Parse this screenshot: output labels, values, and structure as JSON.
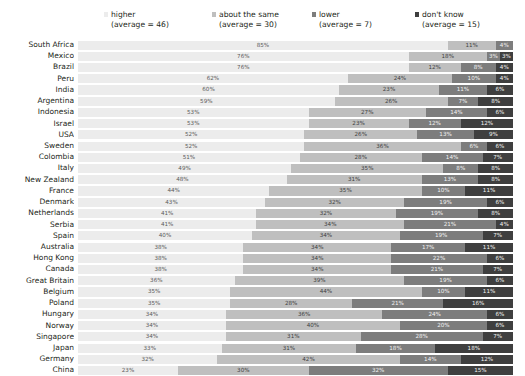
{
  "legend": {
    "items": [
      {
        "label": "higher",
        "sub": "(average = 46)",
        "color": "#ececec"
      },
      {
        "label": "about the same",
        "sub": "(average = 30)",
        "color": "#bfbfbf"
      },
      {
        "label": "lower",
        "sub": "(average = 7)",
        "color": "#7d7d7d"
      },
      {
        "label": "don't know",
        "sub": "(average = 15)",
        "color": "#3f3f3f"
      }
    ]
  },
  "chart_data": {
    "type": "bar",
    "orientation": "horizontal",
    "stacked": true,
    "stack_total": 100,
    "unit": "%",
    "title": "",
    "xlabel": "",
    "ylabel": "",
    "xlim": [
      0,
      100
    ],
    "grid": false,
    "legend_position": "top",
    "series": [
      {
        "name": "higher",
        "average": 46,
        "color": "#ececec"
      },
      {
        "name": "about the same",
        "average": 30,
        "color": "#bfbfbf"
      },
      {
        "name": "lower",
        "average": 7,
        "color": "#7d7d7d"
      },
      {
        "name": "don't know",
        "average": 15,
        "color": "#3f3f3f"
      }
    ],
    "categories": [
      "South Africa",
      "Mexico",
      "Brazil",
      "Peru",
      "India",
      "Argentina",
      "Indonesia",
      "Israel",
      "USA",
      "Sweden",
      "Colombia",
      "Italy",
      "New Zealand",
      "France",
      "Denmark",
      "Netherlands",
      "Serbia",
      "Spain",
      "Australia",
      "Hong Kong",
      "Canada",
      "Great Britain",
      "Belgium",
      "Poland",
      "Hungary",
      "Norway",
      "Singapore",
      "Japan",
      "Germany",
      "China"
    ],
    "rows": [
      {
        "category": "South Africa",
        "values": [
          85,
          11,
          4,
          0
        ],
        "labels": [
          "85%",
          "11%",
          "4%",
          ""
        ]
      },
      {
        "category": "Mexico",
        "values": [
          76,
          18,
          3,
          3
        ],
        "labels": [
          "76%",
          "18%",
          "3%",
          "3%"
        ]
      },
      {
        "category": "Brazil",
        "values": [
          76,
          12,
          8,
          4
        ],
        "labels": [
          "76%",
          "12%",
          "8%",
          "4%"
        ]
      },
      {
        "category": "Peru",
        "values": [
          62,
          24,
          10,
          4
        ],
        "labels": [
          "62%",
          "24%",
          "10%",
          "4%"
        ]
      },
      {
        "category": "India",
        "values": [
          60,
          23,
          11,
          6
        ],
        "labels": [
          "60%",
          "23%",
          "11%",
          "6%"
        ]
      },
      {
        "category": "Argentina",
        "values": [
          59,
          26,
          7,
          8
        ],
        "labels": [
          "59%",
          "26%",
          "7%",
          "8%"
        ]
      },
      {
        "category": "Indonesia",
        "values": [
          53,
          27,
          14,
          6
        ],
        "labels": [
          "53%",
          "27%",
          "14%",
          "6%"
        ]
      },
      {
        "category": "Israel",
        "values": [
          53,
          23,
          12,
          12
        ],
        "labels": [
          "53%",
          "23%",
          "12%",
          "12%"
        ]
      },
      {
        "category": "USA",
        "values": [
          52,
          26,
          13,
          9
        ],
        "labels": [
          "52%",
          "26%",
          "13%",
          "9%"
        ]
      },
      {
        "category": "Sweden",
        "values": [
          52,
          36,
          6,
          6
        ],
        "labels": [
          "52%",
          "36%",
          "6%",
          "6%"
        ]
      },
      {
        "category": "Colombia",
        "values": [
          51,
          28,
          14,
          7
        ],
        "labels": [
          "51%",
          "28%",
          "14%",
          "7%"
        ]
      },
      {
        "category": "Italy",
        "values": [
          49,
          35,
          8,
          8
        ],
        "labels": [
          "49%",
          "35%",
          "8%",
          "8%"
        ]
      },
      {
        "category": "New Zealand",
        "values": [
          48,
          31,
          13,
          8
        ],
        "labels": [
          "48%",
          "31%",
          "13%",
          "8%"
        ]
      },
      {
        "category": "France",
        "values": [
          44,
          35,
          10,
          11
        ],
        "labels": [
          "44%",
          "35%",
          "10%",
          "11%"
        ]
      },
      {
        "category": "Denmark",
        "values": [
          43,
          32,
          19,
          6
        ],
        "labels": [
          "43%",
          "32%",
          "19%",
          "6%"
        ]
      },
      {
        "category": "Netherlands",
        "values": [
          41,
          32,
          19,
          8
        ],
        "labels": [
          "41%",
          "32%",
          "19%",
          "8%"
        ]
      },
      {
        "category": "Serbia",
        "values": [
          41,
          34,
          21,
          4
        ],
        "labels": [
          "41%",
          "34%",
          "21%",
          "4%"
        ]
      },
      {
        "category": "Spain",
        "values": [
          40,
          34,
          19,
          7
        ],
        "labels": [
          "40%",
          "34%",
          "19%",
          "7%"
        ]
      },
      {
        "category": "Australia",
        "values": [
          38,
          34,
          17,
          11
        ],
        "labels": [
          "38%",
          "34%",
          "17%",
          "11%"
        ]
      },
      {
        "category": "Hong Kong",
        "values": [
          38,
          34,
          22,
          6
        ],
        "labels": [
          "38%",
          "34%",
          "22%",
          "6%"
        ]
      },
      {
        "category": "Canada",
        "values": [
          38,
          34,
          21,
          7
        ],
        "labels": [
          "38%",
          "34%",
          "21%",
          "7%"
        ]
      },
      {
        "category": "Great Britain",
        "values": [
          36,
          39,
          19,
          6
        ],
        "labels": [
          "36%",
          "39%",
          "19%",
          "6%"
        ]
      },
      {
        "category": "Belgium",
        "values": [
          35,
          44,
          10,
          11
        ],
        "labels": [
          "35%",
          "44%",
          "10%",
          "11%"
        ]
      },
      {
        "category": "Poland",
        "values": [
          35,
          28,
          21,
          16
        ],
        "labels": [
          "35%",
          "28%",
          "21%",
          "16%"
        ]
      },
      {
        "category": "Hungary",
        "values": [
          34,
          36,
          24,
          6
        ],
        "labels": [
          "34%",
          "36%",
          "24%",
          "6%"
        ]
      },
      {
        "category": "Norway",
        "values": [
          34,
          40,
          20,
          6
        ],
        "labels": [
          "34%",
          "40%",
          "20%",
          "6%"
        ]
      },
      {
        "category": "Singapore",
        "values": [
          34,
          31,
          28,
          7
        ],
        "labels": [
          "34%",
          "31%",
          "28%",
          "7%"
        ]
      },
      {
        "category": "Japan",
        "values": [
          33,
          31,
          18,
          18
        ],
        "labels": [
          "33%",
          "31%",
          "18%",
          "18%"
        ]
      },
      {
        "category": "Germany",
        "values": [
          32,
          42,
          14,
          12
        ],
        "labels": [
          "32%",
          "42%",
          "14%",
          "12%"
        ]
      },
      {
        "category": "China",
        "values": [
          23,
          30,
          32,
          15
        ],
        "labels": [
          "23%",
          "30%",
          "32%",
          "15%"
        ]
      }
    ]
  }
}
